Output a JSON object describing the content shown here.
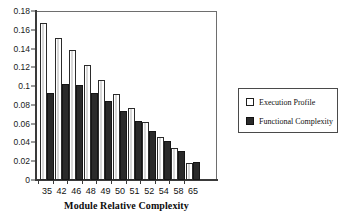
{
  "chart_data": {
    "type": "bar",
    "title": "",
    "xlabel": "Module Relative Complexity",
    "ylabel": "",
    "categories": [
      "35",
      "42",
      "46",
      "48",
      "49",
      "50",
      "51",
      "52",
      "54",
      "58",
      "65"
    ],
    "series": [
      {
        "name": "Execution Profile",
        "swatch": "open",
        "color": "#ffffff",
        "values": [
          0.167,
          0.151,
          0.138,
          0.122,
          0.107,
          0.092,
          0.077,
          0.062,
          0.046,
          0.034,
          0.018
        ]
      },
      {
        "name": "Functional Complexity",
        "swatch": "filled",
        "color": "#2a2a2a",
        "values": [
          0.093,
          0.102,
          0.101,
          0.093,
          0.084,
          0.074,
          0.063,
          0.052,
          0.042,
          0.031,
          0.019
        ]
      }
    ],
    "ylim": [
      0,
      0.18
    ],
    "ytick_values": [
      0,
      0.02,
      0.04,
      0.06,
      0.08,
      0.1,
      0.12,
      0.14,
      0.16,
      0.18
    ],
    "ytick_labels": [
      "0",
      "0.02",
      "0.04",
      "0.06",
      "0.08",
      "0.1",
      "0.12",
      "0.14",
      "0.16",
      "0.18"
    ],
    "grid": false,
    "legend_position": "right"
  },
  "legend": {
    "entries": [
      {
        "label": "Execution Profile"
      },
      {
        "label": "Functional Complexity"
      }
    ]
  },
  "axis": {
    "x_title": "Module Relative Complexity"
  }
}
